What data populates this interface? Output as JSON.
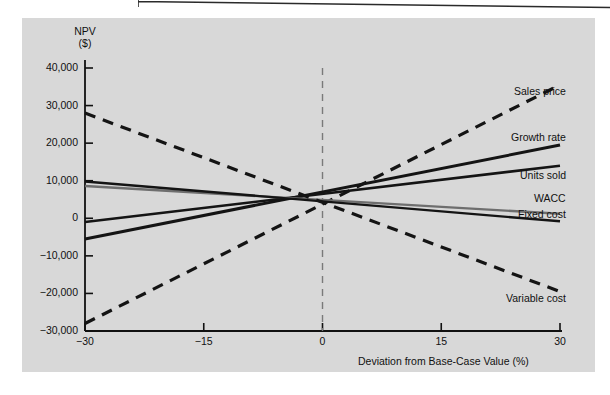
{
  "figure": {
    "background_color": "#d8d8d8",
    "page_color": "#ffffff",
    "scan_rule_color": "#2b2b2b"
  },
  "axes": {
    "y_title_line1": "NPV",
    "y_title_line2": "($)",
    "x_title": "Deviation from Base-Case Value (%)",
    "y_ticks": [
      "40,000",
      "30,000",
      "20,000",
      "10,000",
      "0",
      "−10,000",
      "−20,000",
      "−30,000"
    ],
    "x_ticks": [
      "−30",
      "−15",
      "0",
      "15",
      "30"
    ]
  },
  "chart_data": {
    "type": "line",
    "title": "",
    "subtitle": "",
    "xlabel": "Deviation from Base-Case Value (%)",
    "ylabel": "NPV ($)",
    "xlim": [
      -30,
      30
    ],
    "ylim": [
      -30000,
      40000
    ],
    "xticks": [
      -30,
      -15,
      0,
      15,
      30
    ],
    "yticks": [
      40000,
      30000,
      20000,
      10000,
      0,
      -10000,
      -20000,
      -30000
    ],
    "grid": false,
    "legend": "inline-right-labels",
    "base_case_npv": 4500,
    "annotations": [
      {
        "text": "vertical dashed reference line at x = 0",
        "x": 0
      }
    ],
    "x": [
      -30,
      30
    ],
    "series": [
      {
        "name": "Sales price",
        "values": [
          -28000,
          35500
        ],
        "style": "dashed",
        "color": "#141414",
        "width": 3.2,
        "label_x": 30,
        "label_y": 33500
      },
      {
        "name": "Growth rate",
        "values": [
          -5500,
          19500
        ],
        "style": "solid",
        "color": "#141414",
        "width": 3.0,
        "label_x": 30,
        "label_y": 21500
      },
      {
        "name": "Units sold",
        "values": [
          -1000,
          14000
        ],
        "style": "solid",
        "color": "#141414",
        "width": 2.6,
        "label_x": 30,
        "label_y": 11200
      },
      {
        "name": "WACC",
        "values": [
          8600,
          1200
        ],
        "style": "solid",
        "color": "#6e6e6e",
        "width": 2.4,
        "label_x": 30,
        "label_y": 5200
      },
      {
        "name": "Fixed cost",
        "values": [
          9800,
          -800
        ],
        "style": "solid",
        "color": "#141414",
        "width": 2.4,
        "label_x": 30,
        "label_y": 1000
      },
      {
        "name": "Variable cost",
        "values": [
          28000,
          -19500
        ],
        "style": "dashed",
        "color": "#141414",
        "width": 3.2,
        "label_x": 30,
        "label_y": -21500
      }
    ]
  }
}
